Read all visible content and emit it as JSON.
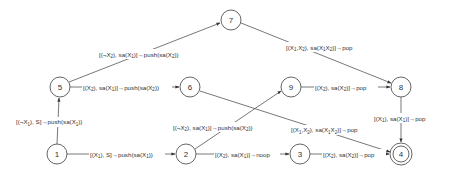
{
  "diagram": {
    "type": "state-transition-diagram",
    "nodes": [
      {
        "id": "1",
        "label": "1",
        "x": 57,
        "y": 154,
        "accepting": false
      },
      {
        "id": "2",
        "label": "2",
        "x": 186,
        "y": 154,
        "accepting": false
      },
      {
        "id": "3",
        "label": "3",
        "x": 300,
        "y": 154,
        "accepting": false
      },
      {
        "id": "4",
        "label": "4",
        "x": 401,
        "y": 154,
        "accepting": true
      },
      {
        "id": "5",
        "label": "5",
        "x": 60,
        "y": 87,
        "accepting": false
      },
      {
        "id": "6",
        "label": "6",
        "x": 190,
        "y": 87,
        "accepting": false
      },
      {
        "id": "7",
        "label": "7",
        "x": 231,
        "y": 20,
        "accepting": false
      },
      {
        "id": "8",
        "label": "8",
        "x": 401,
        "y": 87,
        "accepting": false
      },
      {
        "id": "9",
        "label": "9",
        "x": 291,
        "y": 87,
        "accepting": false
      }
    ],
    "edges": [
      {
        "from": "1",
        "to": "2",
        "label": "[(X1), S]→push(sa(X1))"
      },
      {
        "from": "1",
        "to": "5",
        "label": "[(¬X1), S]→push(sa(X1))"
      },
      {
        "from": "5",
        "to": "6",
        "label": "[(X2), sa(X1)]→push(sa(X2))"
      },
      {
        "from": "5",
        "to": "7",
        "label": "[(¬X2), sa(X1)]→push(sa(X2))"
      },
      {
        "from": "6",
        "to": "4",
        "label": "[(X1,X2), sa(X1X2)]→pop"
      },
      {
        "from": "7",
        "to": "8",
        "label": "[(X1,X2), sa(X1X2)]→pop"
      },
      {
        "from": "2",
        "to": "9",
        "label": "[(¬X2), sa(X1)]→push(sa(X2))"
      },
      {
        "from": "2",
        "to": "3",
        "label": "[(X2), sa(X1)]→noop"
      },
      {
        "from": "9",
        "to": "8",
        "label": "[(X2), sa(X2)]→pop"
      },
      {
        "from": "3",
        "to": "4",
        "label": "[(X2), sa(X2)]→pop"
      },
      {
        "from": "8",
        "to": "4",
        "label": "[(X1), sa(X1)]→pop"
      }
    ]
  },
  "labels": {
    "n1": "1",
    "n2": "2",
    "n3": "3",
    "n4": "4",
    "n5": "5",
    "n6": "6",
    "n7": "7",
    "n8": "8",
    "n9": "9",
    "e_1_2": {
      "pre": "[(X",
      "s1": "1",
      "mid": "), S]→push(sa(X",
      "s2": "1",
      "post": "))"
    },
    "e_1_5": {
      "pre": "[(¬X",
      "s1": "1",
      "mid": "), S]→push(sa(X",
      "s2": "1",
      "post": "))"
    },
    "e_5_6": {
      "a": "[(X",
      "s1": "2",
      "b": "), sa(X",
      "s2": "1",
      "c": ")]→push(sa(X",
      "s3": "2",
      "d": "))"
    },
    "e_5_7": {
      "a": "[(¬X",
      "s1": "2",
      "b": "), sa(X",
      "s2": "1",
      "c": ")]→push(sa(X",
      "s3": "2",
      "d": "))"
    },
    "e_6_4": {
      "a": "[(X",
      "s1": "1",
      "b": ",X",
      "s2": "2",
      "c": "), sa(X",
      "s3": "1",
      "d": "X",
      "s4": "2",
      "e": ")]→pop"
    },
    "e_7_8": {
      "a": "[(X",
      "s1": "1",
      "b": ",X",
      "s2": "2",
      "c": "), sa(X",
      "s3": "1",
      "d": "X",
      "s4": "2",
      "e": ")]→pop"
    },
    "e_2_9": {
      "a": "[(¬X",
      "s1": "2",
      "b": "), sa(X",
      "s2": "1",
      "c": ")]→push(sa(X",
      "s3": "2",
      "d": "))"
    },
    "e_2_3": {
      "a": "[(X",
      "s1": "2",
      "b": "), sa(X",
      "s2": "1",
      "c": ")]→noop"
    },
    "e_9_8": {
      "a": "[(X",
      "s1": "2",
      "b": "), sa(X",
      "s2": "2",
      "c": ")]→pop"
    },
    "e_3_4": {
      "a": "[(X",
      "s1": "2",
      "b": "), sa(X",
      "s2": "2",
      "c": ")]→pop"
    },
    "e_8_4": {
      "a": "[(X",
      "s1": "1",
      "b": "), sa(X",
      "s2": "1",
      "c": ")]→pop"
    }
  },
  "colors": {
    "stroke": "#555555",
    "text": "#333333",
    "background": "#ffffff"
  }
}
